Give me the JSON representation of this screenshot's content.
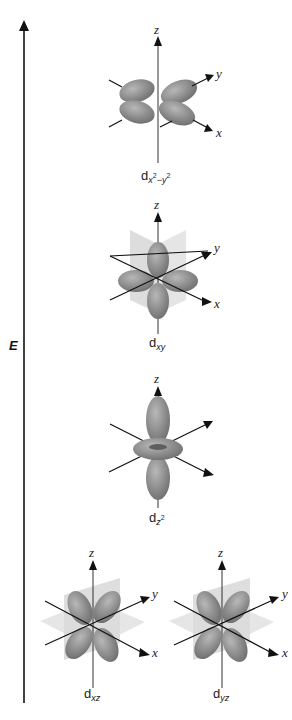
{
  "energy_axis": {
    "label": "E",
    "direction": "up"
  },
  "colors": {
    "lobe": "#8a8a8a",
    "lobe_highlight": "#b3b3b3",
    "plane": "#d6d6d6",
    "axis": "#111111"
  },
  "orbitals": [
    {
      "id": "dx2-y2",
      "base": "d",
      "sub": "x",
      "sub_sup1": "2",
      "sub_mid": "−y",
      "sub_sup2": "2",
      "axes": {
        "z": "z",
        "y": "y",
        "x": "x"
      }
    },
    {
      "id": "dxy",
      "base": "d",
      "sub": "xy",
      "axes": {
        "z": "z",
        "y": "y",
        "x": "x"
      }
    },
    {
      "id": "dz2",
      "base": "d",
      "sub": "z",
      "sub_sup": "2",
      "axes": {
        "z": "z"
      }
    },
    {
      "id": "dxz",
      "base": "d",
      "sub": "xz",
      "axes": {
        "z": "z",
        "y": "y",
        "x": "x"
      }
    },
    {
      "id": "dyz",
      "base": "d",
      "sub": "yz",
      "axes": {
        "z": "z",
        "y": "y",
        "x": "x",
        "y_left": "y",
        "x_left": "x"
      }
    }
  ]
}
